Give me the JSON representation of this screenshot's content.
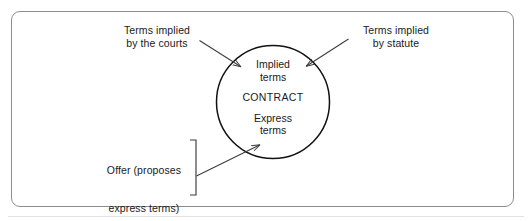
{
  "diagram": {
    "type": "concept-diagram",
    "frame": {
      "border_color": "#8a8d91",
      "background": "#ffffff"
    },
    "stroke_color": "#3c3c3c",
    "circle": {
      "label_top_line1": "Implied",
      "label_top_line2": "terms",
      "label_center": "CONTRACT",
      "label_bottom_line1": "Express",
      "label_bottom_line2": "terms"
    },
    "labels": {
      "left_line1": "Terms implied",
      "left_line2": "by the courts",
      "right_line1": "Terms implied",
      "right_line2": "by statute"
    },
    "offer_group": {
      "line1": "Offer (proposes",
      "line2": "express terms)",
      "plus": "+",
      "line3": "Acceptance"
    },
    "arrows": [
      {
        "name": "courts-to-implied-terms",
        "from": "Terms implied by the courts",
        "to": "Implied terms"
      },
      {
        "name": "statute-to-implied-terms",
        "from": "Terms implied by statute",
        "to": "Implied terms"
      },
      {
        "name": "offer-acceptance-to-express-terms",
        "from": "Offer + Acceptance",
        "to": "Express terms"
      }
    ]
  }
}
